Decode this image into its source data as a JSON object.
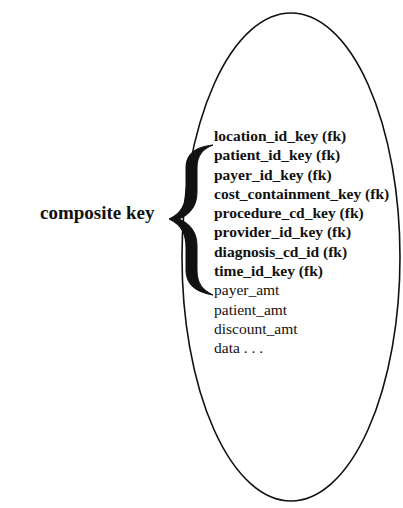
{
  "diagram": {
    "composite_label": "composite key",
    "entity_shape": "ellipse",
    "key_fields": [
      "location_id_key (fk)",
      "patient_id_key (fk)",
      "payer_id_key (fk)",
      "cost_containment_key (fk)",
      "procedure_cd_key (fk)",
      "provider_id_key (fk)",
      "diagnosis_cd_id (fk)",
      "time_id_key (fk)"
    ],
    "attribute_fields": [
      "payer_amt",
      "patient_amt",
      "discount_amt",
      "data . . ."
    ],
    "brace_icon": "curly-brace-left",
    "colors": {
      "stroke": "#111111",
      "background": "#ffffff"
    }
  }
}
